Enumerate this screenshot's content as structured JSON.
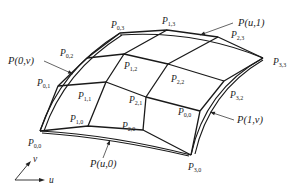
{
  "diagram": {
    "type": "bicubic-surface-control-net",
    "control_points": [
      {
        "id": "P00",
        "label": "P",
        "sub": "0,0",
        "x": 40,
        "y": 131,
        "lx": 28,
        "ly": 146
      },
      {
        "id": "P10",
        "label": "P",
        "sub": "1,0",
        "x": 88,
        "y": 126,
        "lx": 70,
        "ly": 122
      },
      {
        "id": "P20",
        "label": "P",
        "sub": "2,0",
        "x": 143,
        "y": 130,
        "lx": 122,
        "ly": 129
      },
      {
        "id": "P30",
        "label": "P",
        "sub": "3,0",
        "x": 191,
        "y": 155,
        "lx": 188,
        "ly": 170
      },
      {
        "id": "P01",
        "label": "P",
        "sub": "0,1",
        "x": 58,
        "y": 86,
        "lx": 37,
        "ly": 86
      },
      {
        "id": "P11",
        "label": "P",
        "sub": "1,1",
        "x": 106,
        "y": 82,
        "lx": 78,
        "ly": 99
      },
      {
        "id": "P21",
        "label": "P",
        "sub": "2,1",
        "x": 146,
        "y": 97,
        "lx": 129,
        "ly": 103
      },
      {
        "id": "P31",
        "label": "P",
        "sub": "0,0",
        "x": 200,
        "y": 111,
        "lx": 178,
        "ly": 115
      },
      {
        "id": "P02",
        "label": "P",
        "sub": "0,2",
        "x": 87,
        "y": 58,
        "lx": 60,
        "ly": 56
      },
      {
        "id": "P12",
        "label": "P",
        "sub": "1,2",
        "x": 124,
        "y": 54,
        "lx": 124,
        "ly": 69
      },
      {
        "id": "P22",
        "label": "P",
        "sub": "2,2",
        "x": 168,
        "y": 64,
        "lx": 171,
        "ly": 82
      },
      {
        "id": "P32",
        "label": "P",
        "sub": "3,2",
        "x": 224,
        "y": 81,
        "lx": 230,
        "ly": 98
      },
      {
        "id": "P03",
        "label": "P",
        "sub": "0,3",
        "x": 120,
        "y": 33,
        "lx": 111,
        "ly": 28
      },
      {
        "id": "P13",
        "label": "P",
        "sub": "1,3",
        "x": 167,
        "y": 30,
        "lx": 162,
        "ly": 24
      },
      {
        "id": "P23",
        "label": "P",
        "sub": "2,3",
        "x": 218,
        "y": 37,
        "lx": 231,
        "ly": 38
      },
      {
        "id": "P33",
        "label": "P",
        "sub": "3,3",
        "x": 263,
        "y": 58,
        "lx": 273,
        "ly": 65
      }
    ],
    "boundary_curves": [
      {
        "id": "P_u1",
        "text": "P(u,1)",
        "lx": 238,
        "ly": 26,
        "ax": 200,
        "ay": 35,
        "bx": 233,
        "by": 23
      },
      {
        "id": "P_0v",
        "text": "P(0,v)",
        "lx": 8,
        "ly": 64,
        "ax": 73,
        "ay": 74,
        "bx": 44,
        "by": 61
      },
      {
        "id": "P_1v",
        "text": "P(1,v)",
        "lx": 237,
        "ly": 123,
        "ax": 210,
        "ay": 112,
        "bx": 234,
        "by": 120
      },
      {
        "id": "P_u0",
        "text": "P(u,0)",
        "lx": 90,
        "ly": 167,
        "ax": 110,
        "ay": 140,
        "bx": 103,
        "by": 158
      }
    ],
    "axes": {
      "u_label": "u",
      "v_label": "v"
    }
  }
}
